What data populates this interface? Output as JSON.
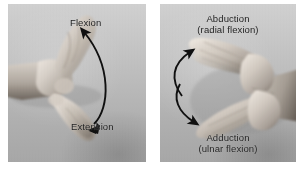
{
  "figure": {
    "name": "wrist-movement-figure",
    "background_color": "#ffffff",
    "panel_count": 2
  },
  "panels": [
    {
      "id": "flexion-extension",
      "photo_description": "grayscale photograph of a hand and forearm viewed from the side, wrist bending up and down",
      "photo_tone": "grayscale",
      "arrow": {
        "type": "curved-double-headed-arrow",
        "orientation": "vertical",
        "bow_direction": "right",
        "color": "#101010"
      },
      "labels": {
        "top": {
          "line1": "Flexion",
          "line2": ""
        },
        "bottom": {
          "line1": "Extension",
          "line2": ""
        }
      }
    },
    {
      "id": "abduction-adduction",
      "photo_description": "grayscale photograph of two overlapping hands, palm up, showing sideways wrist deviation",
      "photo_tone": "grayscale",
      "arrow": {
        "type": "curved-double-headed-arrow",
        "orientation": "vertical",
        "bow_direction": "left",
        "color": "#101010"
      },
      "labels": {
        "top": {
          "line1": "Abduction",
          "line2": "(radial flexion)"
        },
        "bottom": {
          "line1": "Adduction",
          "line2": "(ulnar flexion)"
        }
      }
    }
  ],
  "colors": {
    "label_text": "#1d1d1d",
    "arrow": "#101010",
    "panel_base": "#b9b9b9",
    "page_background": "#ffffff"
  }
}
